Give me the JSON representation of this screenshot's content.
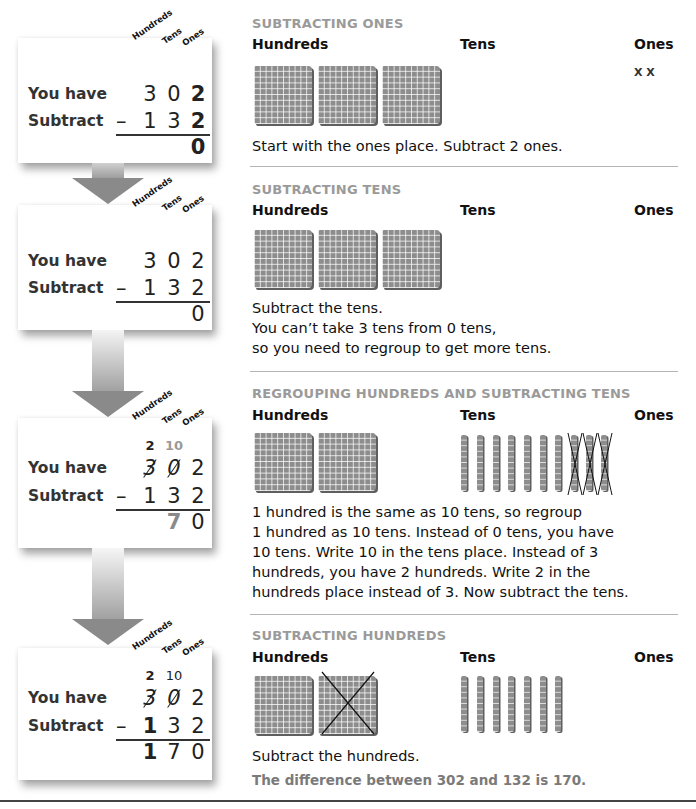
{
  "place_labels": {
    "hundreds": "Hundreds",
    "tens": "Tens",
    "ones": "Ones"
  },
  "row_labels": {
    "have": "You have",
    "subtract": "Subtract"
  },
  "minus_sign": "–",
  "steps": [
    {
      "title": "SUBTRACTING ONES",
      "work": {
        "carry": {
          "hundreds": "",
          "tens": ""
        },
        "have": [
          "3",
          "0",
          "2"
        ],
        "subtract": [
          "1",
          "3",
          "2"
        ],
        "result": [
          "",
          "",
          "0"
        ]
      },
      "blocks": {
        "hundreds": 3,
        "hundreds_crossed": 0,
        "tens": 0,
        "tens_crossed": 0,
        "ones_marks": "X X"
      },
      "text": [
        "Start with the ones place. Subtract 2 ones."
      ]
    },
    {
      "title": "SUBTRACTING TENS",
      "work": {
        "carry": {
          "hundreds": "",
          "tens": ""
        },
        "have": [
          "3",
          "0",
          "2"
        ],
        "subtract": [
          "1",
          "3",
          "2"
        ],
        "result": [
          "",
          "",
          "0"
        ]
      },
      "blocks": {
        "hundreds": 3,
        "hundreds_crossed": 0,
        "tens": 0,
        "tens_crossed": 0,
        "ones_marks": ""
      },
      "text": [
        "Subtract the tens.",
        "You can’t take 3 tens from 0 tens,",
        "so you need to regroup to get more tens."
      ]
    },
    {
      "title": "REGROUPING HUNDREDS AND SUBTRACTING TENS",
      "work": {
        "carry": {
          "hundreds": "2",
          "tens": "10"
        },
        "have": [
          "3",
          "0",
          "2"
        ],
        "subtract": [
          "1",
          "3",
          "2"
        ],
        "result": [
          "",
          "7",
          "0"
        ]
      },
      "blocks": {
        "hundreds": 2,
        "hundreds_crossed": 0,
        "tens": 10,
        "tens_crossed": 3,
        "ones_marks": ""
      },
      "text": [
        "1 hundred is the same as 10 tens, so regroup",
        "1 hundred as 10 tens. Instead of 0 tens, you have",
        "10 tens. Write 10 in the tens place. Instead of 3",
        "hundreds, you have 2 hundreds. Write 2 in the",
        "hundreds place instead of 3. Now subtract the tens."
      ]
    },
    {
      "title": "SUBTRACTING HUNDREDS",
      "work": {
        "carry": {
          "hundreds": "2",
          "tens": "10"
        },
        "have": [
          "3",
          "0",
          "2"
        ],
        "subtract": [
          "1",
          "3",
          "2"
        ],
        "result": [
          "1",
          "7",
          "0"
        ]
      },
      "blocks": {
        "hundreds": 2,
        "hundreds_crossed": 1,
        "tens": 7,
        "tens_crossed": 0,
        "ones_marks": ""
      },
      "text": [
        "Subtract the hundreds."
      ],
      "conclusion": "The difference between 302 and 132 is 170."
    }
  ],
  "colors": {
    "title_gray": "#9a9a9a",
    "block_gray": "#8d8d8d",
    "arrow_gray": "#8a8a8a",
    "divider": "#b5b5b5"
  }
}
